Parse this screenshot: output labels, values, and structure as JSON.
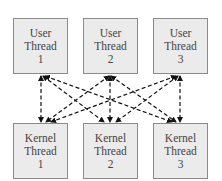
{
  "diagram": {
    "user_threads": [
      {
        "line1": "User",
        "line2": "Thread",
        "line3": "1"
      },
      {
        "line1": "User",
        "line2": "Thread",
        "line3": "2"
      },
      {
        "line1": "User",
        "line2": "Thread",
        "line3": "3"
      }
    ],
    "kernel_threads": [
      {
        "line1": "Kernel",
        "line2": "Thread",
        "line3": "1"
      },
      {
        "line1": "Kernel",
        "line2": "Thread",
        "line3": "2"
      },
      {
        "line1": "Kernel",
        "line2": "Thread",
        "line3": "3"
      }
    ],
    "edges": [
      [
        "User Thread 1",
        "Kernel Thread 1"
      ],
      [
        "User Thread 1",
        "Kernel Thread 2"
      ],
      [
        "User Thread 1",
        "Kernel Thread 3"
      ],
      [
        "User Thread 2",
        "Kernel Thread 1"
      ],
      [
        "User Thread 2",
        "Kernel Thread 2"
      ],
      [
        "User Thread 2",
        "Kernel Thread 3"
      ],
      [
        "User Thread 3",
        "Kernel Thread 1"
      ],
      [
        "User Thread 3",
        "Kernel Thread 2"
      ],
      [
        "User Thread 3",
        "Kernel Thread 3"
      ]
    ],
    "edge_style": "dashed, bidirectional arrows",
    "colors": {
      "box_fill": "#ebebeb",
      "box_border": "#8a8a8a",
      "edge": "#111111",
      "text": "#444444"
    }
  }
}
